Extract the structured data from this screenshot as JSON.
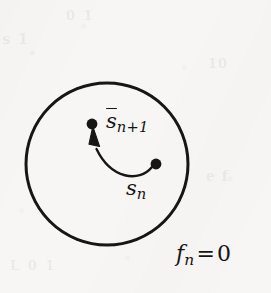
{
  "figure": {
    "name": "constraint-surface-state-update-diagram",
    "background_color": "#f7f6f4",
    "ink_color": "#141414"
  },
  "circle": {
    "name": "constraint-surface-circle",
    "center_x": 107,
    "center_y": 164,
    "radius": 81,
    "stroke_width": 3,
    "stroke_color": "#141414",
    "fill": "none"
  },
  "points": [
    {
      "id": "s-n",
      "label_text": "s",
      "label_accent": "bar",
      "label_subscript": "n",
      "x": 156,
      "y": 164,
      "radius": 5.4,
      "color": "#141414"
    },
    {
      "id": "s-n-plus-1",
      "label_text": "s",
      "label_accent": "bar",
      "label_subscript": "n+1",
      "x": 92,
      "y": 124,
      "radius": 5.4,
      "color": "#141414"
    }
  ],
  "arrow": {
    "name": "state-update-arrow",
    "from_point": "s-n",
    "to_point": "s-n-plus-1",
    "path": "M 152 167 C 138 182, 112 180, 97 148",
    "stroke_width": 2.4,
    "stroke_color": "#141414",
    "head_style": "solid-triangle",
    "head_direction": "up"
  },
  "labels": {
    "s_n_plus_1": {
      "name": "label-s-n-plus-1",
      "base": "s",
      "subscript": "n+1",
      "accent": "bar",
      "full_text": "s̄n+1",
      "x": 106,
      "y": 109
    },
    "s_n": {
      "name": "label-s-n",
      "base": "s",
      "subscript": "n",
      "accent": "bar",
      "full_text": "s̄n",
      "x": 126,
      "y": 176
    },
    "constraint": {
      "name": "label-constraint-equation",
      "base": "f",
      "subscript": "n",
      "operator": "=",
      "value": "0",
      "full_text": "fn = 0",
      "x": 176,
      "y": 241
    }
  },
  "ghost_artifacts": {
    "top_left": "s 1",
    "top_mid": "0 1",
    "right_mid": "10",
    "right_low": "e f",
    "bottom": "L   0  1"
  }
}
